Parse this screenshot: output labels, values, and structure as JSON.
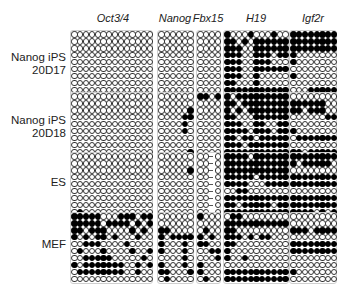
{
  "genes": [
    {
      "name": "Oct3/4",
      "x": 71,
      "cols": 14
    },
    {
      "name": "Nanog",
      "x": 158,
      "cols": 6
    },
    {
      "name": "Fbx15",
      "x": 197,
      "cols": 4
    },
    {
      "name": "H19",
      "x": 224,
      "cols": 11
    },
    {
      "name": "Igf2r",
      "x": 290,
      "cols": 8
    }
  ],
  "samples": [
    {
      "label_line1": "Nanog iPS",
      "label_line2": "20D17",
      "y": 31
    },
    {
      "label_line1": "Nanog iPS",
      "label_line2": "20D18",
      "y": 93
    },
    {
      "label_line1": "ES",
      "label_line2": "",
      "y": 153
    },
    {
      "label_line1": "MEF",
      "label_line2": "",
      "y": 213
    }
  ],
  "legend": {
    "filled": "methylated CpG",
    "open": "unmethylated CpG"
  },
  "grids": {
    "0": {
      "0": [
        "00000000000000",
        "00000000000000",
        "00000000000000",
        "00000000000000",
        "00000000000000",
        "00000000000000",
        "00000000000000",
        "00000000000000",
        "00000000000000",
        "00000000000000"
      ],
      "1": [
        "000000",
        "000000",
        "000000",
        "000000",
        "000000",
        "000000",
        "000000",
        "000000",
        "000000",
        "000000"
      ],
      "2": [
        "0000",
        "0000",
        "0000",
        "0000",
        "0000",
        "0000",
        "0000",
        "0000",
        "0000",
        "0000"
      ],
      "3": [
        "10001000100",
        "11010111111",
        "11100111111",
        "11100111011",
        "11100111000",
        "11100111111",
        "11100100000",
        "11000100000",
        "11111111111",
        "00000000000"
      ],
      "4": [
        "11111111",
        "11111111",
        "11111111",
        "10000000",
        "10000000",
        "00000000",
        "10000000",
        "00000000",
        "00011111",
        "00000000"
      ]
    },
    "1": {
      "0": [
        "00000000000000",
        "00000000000000",
        "00000000000000",
        "00000000000000",
        "00000000000000",
        "00000000000000",
        "00000000000000",
        "00000000000000",
        "00000000000000",
        "00000000000010"
      ],
      "1": [
        "000000",
        "000000",
        "000001",
        "000011",
        "000010",
        "000010",
        "000000",
        "000000",
        "000001",
        "000000"
      ],
      "2": [
        "1101",
        "0000",
        "0000",
        "0000",
        "0000",
        "0000",
        "0000",
        "0000",
        "0000",
        "0000"
      ],
      "3": [
        "10111111111",
        "11011111111",
        "10101111111",
        "11000111111",
        "11100110011",
        "11110111011",
        "11011011111",
        "11101111111",
        "11111111111",
        "11110111111"
      ],
      "4": [
        "00000000",
        "11111100",
        "11011100",
        "00000011",
        "00000000",
        "10000000",
        "01111111",
        "00000000",
        "11011111",
        "00000000"
      ]
    },
    "2": {
      "0": [
        "00000000000000",
        "00000000000000",
        "00000000000000",
        "00000000000000",
        "00000000000000",
        "00000000000000",
        "00000000000000",
        "00000000000000",
        "01000000000000",
        "00000000000000"
      ],
      "1": [
        "000000",
        "000000",
        "000001",
        "000000",
        "000000",
        "000000",
        "000000",
        "000000",
        "000000",
        "000000"
      ],
      "2": [
        "00-0",
        "00-0",
        "00-0",
        "00-0",
        "00-0",
        "00-0",
        "00-0",
        "00-0",
        "00-0",
        "00-0"
      ],
      "3": [
        "11110111111",
        "11111111111",
        "11111111111",
        "11111011111",
        "11110001111",
        "00110000000",
        "11111111111",
        "11011111011",
        "11111111111",
        "11101111111"
      ],
      "4": [
        "11111111",
        "10111110",
        "00000000",
        "11111111",
        "11111111",
        "00000000",
        "11111111",
        "11111111",
        "11110101",
        "00000000"
      ]
    },
    "3": {
      "0": [
        "11111000111011",
        "11111011110101",
        "11011100001010",
        "10101101000100",
        "00111000010000",
        "01000100001001",
        "00111110000010",
        "10111111100101",
        "01111111100100",
        "00000000000000"
      ],
      "1": [
        "000000",
        "000000",
        "110000",
        "101111",
        "100010",
        "100010",
        "000010",
        "100010",
        "110001",
        "010000"
      ],
      "2": [
        "1000",
        "0000",
        "0100",
        "1010",
        "1100",
        "0011",
        "0001",
        "1000",
        "1000",
        "0100"
      ],
      "3": [
        "01100000000",
        "11111111111",
        "11000000000",
        "11101011000",
        "11000000000",
        "10000000000",
        "10010000000",
        "00000000000",
        "11111111111",
        "11111111111"
      ],
      "4": [
        "00000000",
        "00000000",
        "11101111",
        "00000000",
        "11111111",
        "11111111",
        "00000000",
        "00000000",
        "10000000",
        "00000000"
      ]
    }
  }
}
